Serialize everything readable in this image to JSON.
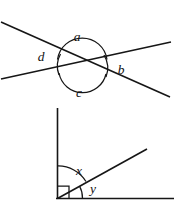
{
  "figures": [
    {
      "id": "crossed-lines",
      "name": "two-intersecting-lines",
      "labels": {
        "top": "a",
        "right": "b",
        "bottom": "c",
        "left": "d"
      }
    },
    {
      "id": "right-angle-rays",
      "name": "right-angle-split-by-ray",
      "labels": {
        "upper": "x",
        "lower": "y"
      }
    }
  ],
  "colors": {
    "ink": "#161616",
    "background": "#ffffff",
    "label": "#111111"
  }
}
